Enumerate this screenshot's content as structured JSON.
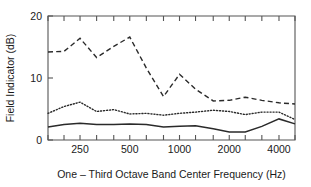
{
  "chart_data": {
    "type": "line",
    "title": "",
    "xlabel": "One – Third Octave Band Center Frequency (Hz)",
    "ylabel": "Field Indicator (dB)",
    "xscale": "log",
    "xlim": [
      160,
      5000
    ],
    "ylim": [
      0,
      20
    ],
    "yticks": [
      0,
      10,
      20
    ],
    "yticklabels": [
      "0",
      "10",
      "20"
    ],
    "xticks": [
      160,
      200,
      250,
      315,
      400,
      500,
      630,
      800,
      1000,
      1250,
      1600,
      2000,
      2500,
      3150,
      4000,
      5000
    ],
    "xticklabels_shown": [
      "250",
      "500",
      "1000",
      "2000",
      "4000"
    ],
    "xticklabel_values": [
      250,
      500,
      1000,
      2000,
      4000
    ],
    "grid": false,
    "legend": "none",
    "x": [
      160,
      200,
      250,
      315,
      400,
      500,
      630,
      800,
      1000,
      1250,
      1600,
      2000,
      2500,
      3150,
      4000,
      5000
    ],
    "series": [
      {
        "name": "upper-curve",
        "style": "dashed",
        "values": [
          14.2,
          14.3,
          16.4,
          13.3,
          15.1,
          16.6,
          11.6,
          7.0,
          10.6,
          8.2,
          6.3,
          6.4,
          6.9,
          6.4,
          6.0,
          5.8
        ]
      },
      {
        "name": "middle-curve",
        "style": "dotted",
        "values": [
          4.3,
          5.4,
          6.1,
          4.6,
          4.9,
          4.2,
          4.3,
          4.0,
          4.3,
          4.5,
          4.8,
          4.6,
          4.1,
          4.5,
          4.5,
          3.3
        ]
      },
      {
        "name": "lower-curve",
        "style": "solid",
        "values": [
          2.1,
          2.5,
          2.7,
          2.5,
          2.5,
          2.6,
          2.5,
          2.1,
          2.2,
          2.3,
          1.8,
          1.3,
          1.3,
          2.2,
          3.4,
          2.6
        ]
      }
    ]
  }
}
